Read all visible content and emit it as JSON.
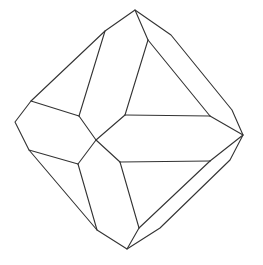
{
  "diagram": {
    "title": "",
    "type": "crystal-line-drawing",
    "stroke_color": "#333333",
    "background": "#ffffff",
    "outline": [
      [
        135,
        10
      ],
      [
        171,
        35
      ],
      [
        232,
        110
      ],
      [
        243,
        135
      ],
      [
        230,
        160
      ],
      [
        160,
        228
      ],
      [
        127,
        249
      ],
      [
        97,
        230
      ],
      [
        29,
        150
      ],
      [
        15,
        122
      ],
      [
        31,
        101
      ],
      [
        105,
        31
      ],
      [
        135,
        10
      ]
    ],
    "edges": [
      [
        [
          105,
          31
        ],
        [
          79,
          116
        ]
      ],
      [
        [
          31,
          101
        ],
        [
          79,
          116
        ]
      ],
      [
        [
          79,
          116
        ],
        [
          96,
          140
        ]
      ],
      [
        [
          135,
          10
        ],
        [
          148,
          40
        ]
      ],
      [
        [
          148,
          40
        ],
        [
          125,
          115
        ]
      ],
      [
        [
          148,
          40
        ],
        [
          210,
          116
        ]
      ],
      [
        [
          125,
          115
        ],
        [
          210,
          116
        ]
      ],
      [
        [
          210,
          116
        ],
        [
          243,
          135
        ]
      ],
      [
        [
          125,
          115
        ],
        [
          96,
          140
        ]
      ],
      [
        [
          96,
          140
        ],
        [
          120,
          162
        ]
      ],
      [
        [
          120,
          162
        ],
        [
          210,
          161
        ]
      ],
      [
        [
          210,
          161
        ],
        [
          243,
          135
        ]
      ],
      [
        [
          120,
          162
        ],
        [
          139,
          228
        ]
      ],
      [
        [
          210,
          161
        ],
        [
          139,
          228
        ]
      ],
      [
        [
          139,
          228
        ],
        [
          127,
          249
        ]
      ],
      [
        [
          96,
          140
        ],
        [
          78,
          164
        ]
      ],
      [
        [
          29,
          150
        ],
        [
          78,
          164
        ]
      ],
      [
        [
          78,
          164
        ],
        [
          97,
          230
        ]
      ]
    ]
  }
}
